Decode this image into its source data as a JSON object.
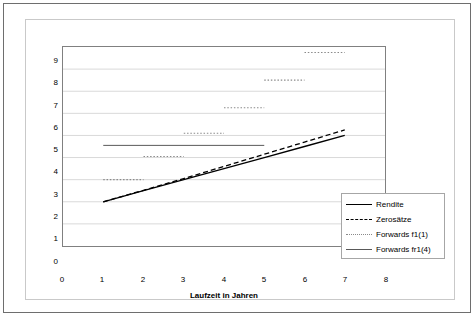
{
  "chart_data": {
    "type": "line",
    "title": "",
    "xlabel": "Laufzeit in Jahren",
    "ylabel": "Zinssatz in %",
    "xlim": [
      0,
      8
    ],
    "ylim": [
      0,
      9
    ],
    "xticks": [
      "0",
      "1",
      "2",
      "3",
      "4",
      "5",
      "6",
      "7",
      "8"
    ],
    "yticks": [
      "0",
      "1",
      "2",
      "3",
      "4",
      "5",
      "6",
      "7",
      "8",
      "9"
    ],
    "grid": "horizontal",
    "legend_position": "inside-bottom-right",
    "series": [
      {
        "name": "Rendite",
        "style": "solid",
        "color": "#000000",
        "x": [
          1,
          2,
          3,
          4,
          5,
          6,
          7
        ],
        "values": [
          2.0,
          2.5,
          3.0,
          3.5,
          4.0,
          4.5,
          5.0
        ]
      },
      {
        "name": "Zerosätze",
        "style": "dashed",
        "color": "#000000",
        "x": [
          1,
          2,
          3,
          4,
          5,
          6,
          7
        ],
        "values": [
          2.0,
          2.52,
          3.05,
          3.6,
          4.15,
          4.7,
          5.25
        ]
      },
      {
        "name": "Forwards f1(1)",
        "style": "dotted",
        "color": "#8a8a8a",
        "segments": [
          {
            "x_start": 1,
            "x_end": 2,
            "value": 3.0
          },
          {
            "x_start": 2,
            "x_end": 3,
            "value": 4.05
          },
          {
            "x_start": 3,
            "x_end": 4,
            "value": 5.1
          },
          {
            "x_start": 4,
            "x_end": 5,
            "value": 6.25
          },
          {
            "x_start": 5,
            "x_end": 6,
            "value": 7.5
          },
          {
            "x_start": 6,
            "x_end": 7,
            "value": 8.75
          }
        ]
      },
      {
        "name": "Forwards fr1(4)",
        "style": "solid",
        "color": "#595959",
        "segments": [
          {
            "x_start": 1,
            "x_end": 5,
            "value": 4.55
          }
        ]
      }
    ]
  },
  "axes": {
    "y_title": "Zinssatz in %",
    "x_title": "Laufzeit in Jahren",
    "y_ticks": [
      "9",
      "8",
      "7",
      "6",
      "5",
      "4",
      "3",
      "2",
      "1",
      "0"
    ],
    "x_ticks": [
      "0",
      "1",
      "2",
      "3",
      "4",
      "5",
      "6",
      "7",
      "8"
    ]
  },
  "legend": {
    "items": [
      {
        "label": "Rendite",
        "key": "solid-thin-line-key"
      },
      {
        "label": "Zerosätze",
        "key": "dashed-line-key"
      },
      {
        "label": "Forwards f1(1)",
        "key": "dotted-line-key"
      },
      {
        "label": "Forwards fr1(4)",
        "key": "solid-gray-line-key"
      }
    ]
  },
  "colors": {
    "outer_border": "#6e6e6e",
    "chart_border": "#c9c9c9",
    "plot_border": "#808080",
    "gridline": "#d9d9d9",
    "series_primary": "#000000",
    "series_forward": "#8a8a8a",
    "series_forward_flat": "#595959"
  }
}
